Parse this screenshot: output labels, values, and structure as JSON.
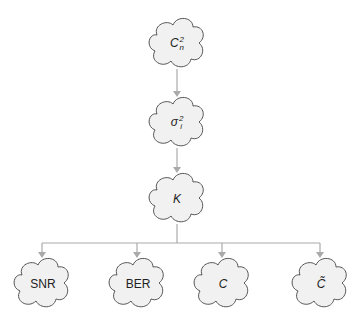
{
  "diagram": {
    "type": "hierarchy",
    "colors": {
      "cloud_fill": "#f1f1f1",
      "cloud_stroke": "#555555",
      "connector": "#aaaaaa",
      "text": "#222222"
    },
    "nodes": [
      {
        "id": "cn2",
        "base": "C",
        "sup": "2",
        "sub": "n",
        "italic": true,
        "cx": 177,
        "cy": 43
      },
      {
        "id": "sigma",
        "base": "σ",
        "sup": "2",
        "sub": "i",
        "italic": true,
        "cx": 177,
        "cy": 122
      },
      {
        "id": "k",
        "label": "K",
        "italic": true,
        "cx": 177,
        "cy": 198
      },
      {
        "id": "snr",
        "label": "SNR",
        "italic": false,
        "cx": 42,
        "cy": 283
      },
      {
        "id": "ber",
        "label": "BER",
        "italic": false,
        "cx": 137,
        "cy": 283
      },
      {
        "id": "c",
        "label": "C",
        "italic": true,
        "cx": 222,
        "cy": 283
      },
      {
        "id": "ctilde",
        "label": "C̃",
        "italic": true,
        "cx": 320,
        "cy": 283
      }
    ],
    "edges": [
      {
        "from": "cn2",
        "to": "sigma"
      },
      {
        "from": "sigma",
        "to": "k"
      },
      {
        "from": "k",
        "to": "snr"
      },
      {
        "from": "k",
        "to": "ber"
      },
      {
        "from": "k",
        "to": "c"
      },
      {
        "from": "k",
        "to": "ctilde"
      }
    ]
  }
}
